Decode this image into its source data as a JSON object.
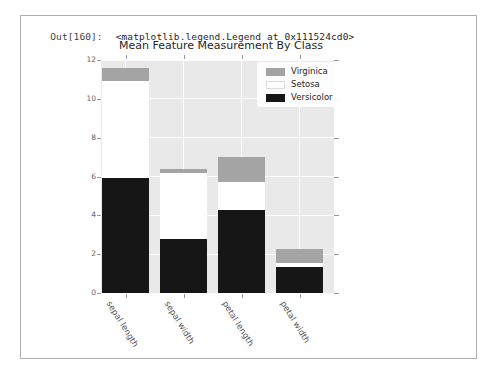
{
  "output_cell": {
    "prompt": "Out[160]:",
    "value": "<matplotlib.legend.Legend at 0x111524cd0>"
  },
  "chart_data": {
    "type": "bar",
    "stacked": true,
    "title": "Mean Feature Measurement By Class",
    "categories": [
      "sepal length",
      "sepal width",
      "petal length",
      "petal width"
    ],
    "series": [
      {
        "name": "Versicolor",
        "color": "#161616",
        "segments": [
          [
            0,
            5.94
          ],
          [
            0,
            2.77
          ],
          [
            0,
            4.26
          ],
          [
            0,
            1.33
          ]
        ]
      },
      {
        "name": "Setosa",
        "color": "#ffffff",
        "segments": [
          [
            5.94,
            10.94
          ],
          [
            2.77,
            6.2
          ],
          [
            4.26,
            5.72
          ],
          [
            1.33,
            1.57
          ]
        ]
      },
      {
        "name": "Virginica",
        "color": "#a4a4a4",
        "segments": [
          [
            10.94,
            11.59
          ],
          [
            6.2,
            6.4
          ],
          [
            5.72,
            7.01
          ],
          [
            1.57,
            2.27
          ]
        ]
      }
    ],
    "legend": {
      "position": "upper right",
      "entries": [
        {
          "label": "Virginica",
          "color": "#a4a4a4"
        },
        {
          "label": "Setosa",
          "color": "#ffffff"
        },
        {
          "label": "Versicolor",
          "color": "#161616"
        }
      ]
    },
    "ylim": [
      0,
      12
    ],
    "yticks": [
      0,
      2,
      4,
      6,
      8,
      10,
      12
    ],
    "grid": true,
    "plot_bg": "#e9e9e9",
    "grid_color": "#ffffff"
  }
}
